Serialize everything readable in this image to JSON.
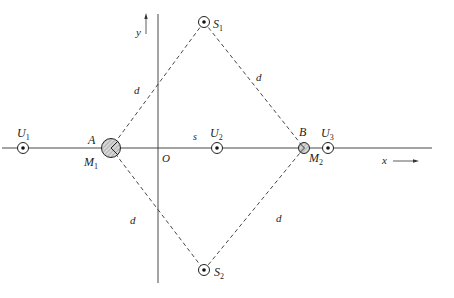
{
  "diagram": {
    "axes": {
      "x_label": "x",
      "y_label": "y",
      "origin_label": "O"
    },
    "sources": [
      {
        "label": "S",
        "sub": "1",
        "x": 204,
        "y": 22
      },
      {
        "label": "S",
        "sub": "2",
        "x": 204,
        "y": 270
      }
    ],
    "receivers": [
      {
        "label": "U",
        "sub": "1",
        "x": 23,
        "y": 148
      },
      {
        "label": "U",
        "sub": "2",
        "x": 217,
        "y": 148
      },
      {
        "label": "U",
        "sub": "3",
        "x": 328,
        "y": 148
      }
    ],
    "mirrors": [
      {
        "point": "A",
        "label": "M",
        "sub": "1",
        "x": 111,
        "y": 148
      },
      {
        "point": "B",
        "label": "M",
        "sub": "2",
        "x": 304,
        "y": 148
      }
    ],
    "edge_labels": {
      "d": "d",
      "s": "s"
    }
  }
}
